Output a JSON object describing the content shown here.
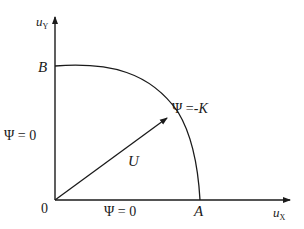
{
  "diagram": {
    "title": "",
    "axes": {
      "y_label_main": "u",
      "y_label_sub": "Y",
      "x_label_main": "u",
      "x_label_sub": "X",
      "origin_label": "0"
    },
    "points": {
      "A": "A",
      "B": "B"
    },
    "boundary_labels": {
      "left": "Ψ = 0",
      "bottom": "Ψ = 0",
      "arc": "Ψ =-",
      "arc_var": "K"
    },
    "vector_label": "U",
    "colors": {
      "stroke": "#1a1a1a",
      "background": "#ffffff"
    }
  }
}
